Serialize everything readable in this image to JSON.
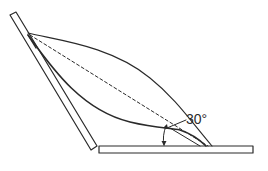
{
  "figure": {
    "angle_annotation": "30°",
    "colors": {
      "line": "#2a2a2a",
      "background": "#ffffff"
    },
    "elements": [
      {
        "name": "inclined-plate",
        "type": "rectangle",
        "orientation": "slanted"
      },
      {
        "name": "base-plate",
        "type": "rectangle",
        "orientation": "horizontal"
      },
      {
        "name": "upper-curve",
        "type": "curve",
        "style": "solid"
      },
      {
        "name": "lower-curve",
        "type": "curve",
        "style": "solid"
      },
      {
        "name": "chord-line",
        "type": "line",
        "style": "dashed"
      },
      {
        "name": "angle-arc",
        "type": "arc-with-arrows",
        "label": "30°"
      }
    ]
  }
}
